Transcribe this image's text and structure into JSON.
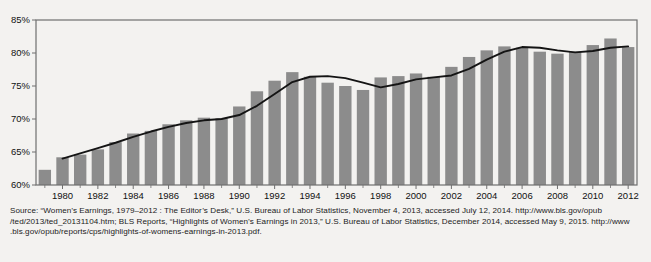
{
  "figure": {
    "background_color": "#f3f2f0",
    "plot_background_color": "#f3f2f0",
    "frame_color": "#6f6f6f",
    "bar_color": "#8c8c8c",
    "line_color": "#141414",
    "text_color": "#1b1b1b"
  },
  "chart_data": {
    "type": "bar",
    "title": "",
    "subtitle": "",
    "xlabel": "",
    "ylabel": "",
    "grid": false,
    "legend": null,
    "ylim": [
      60,
      85
    ],
    "ytick_labels": [
      "60%",
      "65%",
      "70%",
      "75%",
      "80%",
      "85%"
    ],
    "ytick_values": [
      60,
      65,
      70,
      75,
      80,
      85
    ],
    "xtick_labels": [
      "1980",
      "1982",
      "1984",
      "1986",
      "1988",
      "1990",
      "1992",
      "1994",
      "1996",
      "1998",
      "2000",
      "2002",
      "2004",
      "2006",
      "2008",
      "2010",
      "2012"
    ],
    "xtick_values": [
      1980,
      1982,
      1984,
      1986,
      1988,
      1990,
      1992,
      1994,
      1996,
      1998,
      2000,
      2002,
      2004,
      2006,
      2008,
      2010,
      2012
    ],
    "categories": [
      1979,
      1980,
      1981,
      1982,
      1983,
      1984,
      1985,
      1986,
      1987,
      1988,
      1989,
      1990,
      1991,
      1992,
      1993,
      1994,
      1995,
      1996,
      1997,
      1998,
      1999,
      2000,
      2001,
      2002,
      2003,
      2004,
      2005,
      2006,
      2007,
      2008,
      2009,
      2010,
      2011,
      2012
    ],
    "series": [
      {
        "name": "Women's earnings as a percent of men's",
        "kind": "bar",
        "values": [
          62.3,
          64.2,
          64.6,
          65.4,
          66.5,
          67.8,
          68.2,
          69.2,
          69.8,
          70.2,
          70.1,
          71.9,
          74.2,
          75.8,
          77.1,
          76.4,
          75.5,
          75.0,
          74.4,
          76.3,
          76.5,
          76.9,
          76.4,
          77.9,
          79.4,
          80.4,
          81.0,
          80.8,
          80.2,
          79.9,
          80.2,
          81.2,
          82.2,
          80.9
        ]
      },
      {
        "name": "Trend",
        "kind": "line",
        "values": [
          null,
          64.0,
          64.8,
          65.6,
          66.4,
          67.3,
          68.1,
          68.8,
          69.4,
          69.8,
          70.0,
          70.6,
          72.0,
          73.8,
          75.6,
          76.4,
          76.5,
          76.2,
          75.5,
          74.8,
          75.3,
          76.0,
          76.3,
          76.6,
          77.6,
          79.0,
          80.2,
          80.9,
          80.8,
          80.4,
          80.1,
          80.3,
          80.8,
          81.0
        ]
      }
    ]
  },
  "source": {
    "lines": [
      "Source: “Women’s Earnings, 1979–2012 : The Editor’s Desk,” U.S. Bureau of Labor Statistics, November 4, 2013, accessed July 12, 2014. http://www.bls.gov/opub",
      "/ted/2013/ted_20131104.htm; BLS Reports, “Highlights of Women’s Earnings in 2013,” U.S. Bureau of Labor Statistics, December 2014, accessed May 9, 2015. http://www",
      ".bls.gov/opub/reports/cps/highlights-of-womens-earnings-in-2013.pdf."
    ]
  }
}
